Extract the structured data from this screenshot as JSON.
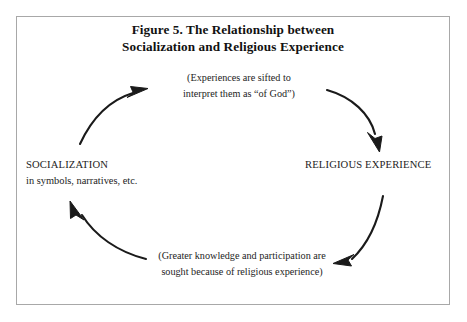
{
  "figure": {
    "title_line1": "Figure 5. The Relationship between",
    "title_line2": "Socialization and Religious Experience",
    "border_color": "#a8a8a8",
    "ink_color": "#1a1a1a",
    "background_color": "#ffffff"
  },
  "nodes": {
    "left": {
      "heading": "SOCIALIZATION",
      "subtext": "in symbols, narratives, etc."
    },
    "right": {
      "heading": "RELIGIOUS EXPERIENCE"
    }
  },
  "captions": {
    "top_line1": "(Experiences are sifted to",
    "top_line2": "interpret them as “of God”)",
    "bottom_line1": "(Greater knowledge and participation are",
    "bottom_line2": "sought because of religious experience)"
  },
  "arrows": [
    {
      "name": "arrow-socialization-to-top",
      "direction": "up-right"
    },
    {
      "name": "arrow-top-to-religious-experience",
      "direction": "down-right"
    },
    {
      "name": "arrow-religious-experience-to-bottom",
      "direction": "down-left"
    },
    {
      "name": "arrow-bottom-to-socialization",
      "direction": "up-left"
    }
  ]
}
